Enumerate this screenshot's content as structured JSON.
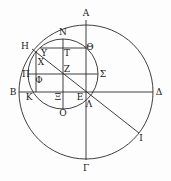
{
  "diagram": {
    "stroke_color": "#2a2a2a",
    "large_circle": {
      "cx": 86,
      "cy": 92,
      "r": 67
    },
    "small_circle": {
      "cx": 63,
      "cy": 74,
      "r": 35
    },
    "labels": [
      {
        "id": "A",
        "text": "Α",
        "x": 86,
        "y": 13
      },
      {
        "id": "N",
        "text": "Ν",
        "x": 63,
        "y": 32
      },
      {
        "id": "H",
        "text": "Η",
        "x": 25,
        "y": 46
      },
      {
        "id": "Theta",
        "text": "Θ",
        "x": 89,
        "y": 47
      },
      {
        "id": "Upsilon",
        "text": "Υ",
        "x": 44,
        "y": 52
      },
      {
        "id": "T",
        "text": "Τ",
        "x": 66,
        "y": 52
      },
      {
        "id": "X",
        "text": "Χ",
        "x": 40,
        "y": 62
      },
      {
        "id": "Z",
        "text": "Ζ",
        "x": 67,
        "y": 70
      },
      {
        "id": "Pi",
        "text": "Π",
        "x": 26,
        "y": 74
      },
      {
        "id": "Sigma",
        "text": "Σ",
        "x": 103,
        "y": 74
      },
      {
        "id": "Phi",
        "text": "Φ",
        "x": 38,
        "y": 79
      },
      {
        "id": "B",
        "text": "Β",
        "x": 13,
        "y": 92
      },
      {
        "id": "Delta",
        "text": "Δ",
        "x": 158,
        "y": 92
      },
      {
        "id": "K",
        "text": "Κ",
        "x": 28,
        "y": 97
      },
      {
        "id": "Xi",
        "text": "Ξ",
        "x": 58,
        "y": 97
      },
      {
        "id": "E",
        "text": "Ε",
        "x": 80,
        "y": 97
      },
      {
        "id": "Lambda",
        "text": "Λ",
        "x": 89,
        "y": 104
      },
      {
        "id": "O",
        "text": "Ο",
        "x": 63,
        "y": 113
      },
      {
        "id": "I",
        "text": "Ι",
        "x": 139,
        "y": 138
      },
      {
        "id": "Gamma",
        "text": "Γ",
        "x": 86,
        "y": 168
      }
    ]
  }
}
